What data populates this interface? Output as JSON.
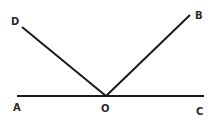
{
  "diagram": {
    "type": "geometry-angles",
    "points": {
      "A": {
        "label": "A",
        "x": 17,
        "y": 96
      },
      "O": {
        "label": "O",
        "x": 106,
        "y": 96
      },
      "C": {
        "label": "C",
        "x": 204,
        "y": 96
      },
      "D": {
        "label": "D",
        "x": 22,
        "y": 27
      },
      "B": {
        "label": "B",
        "x": 190,
        "y": 15
      }
    },
    "segments": [
      "AC",
      "OD",
      "OB"
    ],
    "line_color": "#1a1a1a"
  }
}
